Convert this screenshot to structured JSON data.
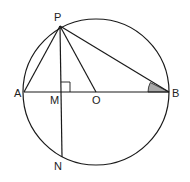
{
  "diagram": {
    "colors": {
      "stroke": "#1a1a1a",
      "angle_fill": "#a9a9a9",
      "background": "#ffffff"
    },
    "circle": {
      "cx": 96,
      "cy": 92,
      "r": 73
    },
    "points": {
      "P": {
        "x": 60,
        "y": 26,
        "label": "P"
      },
      "A": {
        "x": 24,
        "y": 92,
        "label": "A"
      },
      "M": {
        "x": 61,
        "y": 92,
        "label": "M"
      },
      "O": {
        "x": 96,
        "y": 92,
        "label": "O"
      },
      "B": {
        "x": 169,
        "y": 92,
        "label": "B"
      },
      "N": {
        "x": 62,
        "y": 157,
        "label": "N"
      }
    },
    "segments": [
      "AB",
      "PA",
      "PB",
      "PO",
      "PN"
    ],
    "markers": {
      "right_angle_at": "M",
      "shaded_angle_at": "B"
    }
  }
}
